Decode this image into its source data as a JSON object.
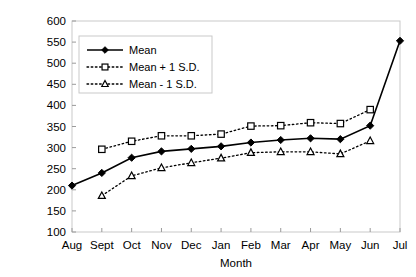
{
  "chart_data": {
    "type": "line",
    "title": "",
    "xlabel": "Month",
    "ylabel": "Snow density (kg m-3)",
    "ylabel_base": "Snow density (kg m",
    "ylabel_exp": "-3",
    "ylabel_close": ")",
    "categories": [
      "Aug",
      "Sept",
      "Oct",
      "Nov",
      "Dec",
      "Jan",
      "Feb",
      "Mar",
      "Apr",
      "May",
      "Jun",
      "Jul"
    ],
    "ylim": [
      100,
      600
    ],
    "ytick_labels": [
      "100",
      "150",
      "200",
      "250",
      "300",
      "350",
      "400",
      "450",
      "500",
      "550",
      "600"
    ],
    "yticks": [
      100,
      150,
      200,
      250,
      300,
      350,
      400,
      450,
      500,
      550,
      600
    ],
    "grid": false,
    "legend_position": "upper-left-inside",
    "series": [
      {
        "name": "Mean",
        "style": "solid",
        "marker": "filled-diamond",
        "x": [
          "Aug",
          "Sept",
          "Oct",
          "Nov",
          "Dec",
          "Jan",
          "Feb",
          "Mar",
          "Apr",
          "May",
          "Jun",
          "Jul"
        ],
        "values": [
          210,
          240,
          276,
          291,
          297,
          303,
          312,
          318,
          322,
          320,
          352,
          553
        ]
      },
      {
        "name": "Mean + 1 S.D.",
        "style": "dotted",
        "marker": "open-square",
        "x": [
          "Sept",
          "Oct",
          "Nov",
          "Dec",
          "Jan",
          "Feb",
          "Mar",
          "Apr",
          "May",
          "Jun"
        ],
        "values": [
          296,
          315,
          328,
          328,
          332,
          351,
          352,
          359,
          357,
          390
        ]
      },
      {
        "name": "Mean - 1 S.D.",
        "style": "dotted",
        "marker": "open-triangle",
        "x": [
          "Sept",
          "Oct",
          "Nov",
          "Dec",
          "Jan",
          "Feb",
          "Mar",
          "Apr",
          "May",
          "Jun"
        ],
        "values": [
          186,
          233,
          252,
          264,
          275,
          288,
          290,
          290,
          285,
          316
        ]
      }
    ]
  },
  "legend": {
    "items": [
      {
        "label": "Mean"
      },
      {
        "label": "Mean + 1 S.D."
      },
      {
        "label": "Mean - 1 S.D."
      }
    ]
  },
  "colors": {
    "line": "#000000",
    "frame": "#c9c9c9",
    "background": "#ffffff"
  }
}
